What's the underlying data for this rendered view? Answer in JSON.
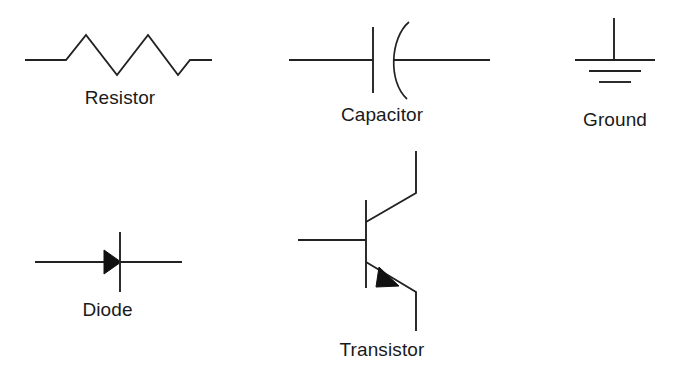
{
  "page": {
    "background_color": "#ffffff",
    "stroke_color": "#222222",
    "fill_color": "#111111",
    "text_color": "#1a1a1a",
    "width": 676,
    "height": 383
  },
  "symbols": [
    {
      "id": "resistor",
      "label": "Resistor",
      "icon": "resistor-zigzag-icon",
      "row": 1,
      "column": 1
    },
    {
      "id": "capacitor",
      "label": "Capacitor",
      "icon": "capacitor-curved-plate-icon",
      "row": 1,
      "column": 2
    },
    {
      "id": "ground",
      "label": "Ground",
      "icon": "ground-three-bar-icon",
      "row": 1,
      "column": 3
    },
    {
      "id": "diode",
      "label": "Diode",
      "icon": "diode-triangle-bar-icon",
      "row": 2,
      "column": 1
    },
    {
      "id": "transistor",
      "label": "Transistor",
      "icon": "npn-transistor-icon",
      "row": 2,
      "column": 2
    }
  ],
  "labels": {
    "resistor": "Resistor",
    "capacitor": "Capacitor",
    "ground": "Ground",
    "diode": "Diode",
    "transistor": "Transistor"
  }
}
